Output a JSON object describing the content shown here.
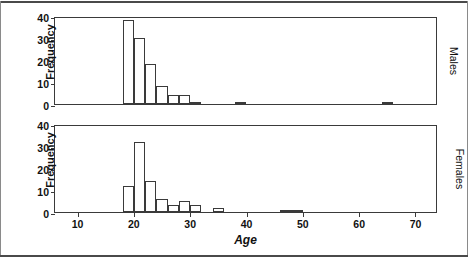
{
  "figure": {
    "xlabel": "Age",
    "ylabel": "Frequency",
    "panels": [
      {
        "tag": "Males"
      },
      {
        "tag": "Females"
      }
    ]
  },
  "axes": {
    "y_ticks": [
      "0",
      "10",
      "20",
      "30",
      "40"
    ],
    "x_ticks": [
      "10",
      "20",
      "30",
      "40",
      "50",
      "60",
      "70"
    ]
  },
  "chart_data": {
    "type": "bar",
    "title": "",
    "subtitle": "",
    "xlabel": "Age",
    "ylabel": "Frequency",
    "xlim": [
      6,
      74
    ],
    "ylim": [
      0,
      40
    ],
    "grid": false,
    "legend_position": "right-rotated-panel-tags",
    "bin_width": 2,
    "panels": [
      {
        "name": "Males",
        "xlabel": "Age",
        "ylabel": "Frequency",
        "ylim": [
          0,
          40
        ],
        "bins": [
          {
            "x0": 18,
            "x1": 20,
            "value": 38
          },
          {
            "x0": 20,
            "x1": 22,
            "value": 30
          },
          {
            "x0": 22,
            "x1": 24,
            "value": 18
          },
          {
            "x0": 24,
            "x1": 26,
            "value": 8
          },
          {
            "x0": 26,
            "x1": 28,
            "value": 4
          },
          {
            "x0": 28,
            "x1": 30,
            "value": 4
          },
          {
            "x0": 30,
            "x1": 32,
            "value": 1
          },
          {
            "x0": 38,
            "x1": 40,
            "value": 1
          },
          {
            "x0": 64,
            "x1": 66,
            "value": 1
          }
        ]
      },
      {
        "name": "Females",
        "xlabel": "Age",
        "ylabel": "Frequency",
        "ylim": [
          0,
          40
        ],
        "bins": [
          {
            "x0": 18,
            "x1": 20,
            "value": 12
          },
          {
            "x0": 20,
            "x1": 22,
            "value": 32
          },
          {
            "x0": 22,
            "x1": 24,
            "value": 14
          },
          {
            "x0": 24,
            "x1": 26,
            "value": 6
          },
          {
            "x0": 26,
            "x1": 28,
            "value": 3
          },
          {
            "x0": 28,
            "x1": 30,
            "value": 5
          },
          {
            "x0": 30,
            "x1": 32,
            "value": 3
          },
          {
            "x0": 34,
            "x1": 36,
            "value": 2
          },
          {
            "x0": 46,
            "x1": 48,
            "value": 1
          },
          {
            "x0": 48,
            "x1": 50,
            "value": 1
          }
        ]
      }
    ]
  },
  "colors": {
    "line": "#3a3a3a",
    "text": "#111111",
    "background": "#ffffff",
    "page_rule": "#4a4a4a"
  }
}
